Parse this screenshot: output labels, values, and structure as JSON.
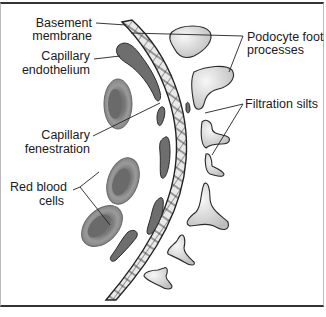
{
  "figure": {
    "labels": {
      "basement_membrane": [
        "Basement",
        "membrane"
      ],
      "capillary_endothelium": [
        "Capillary",
        "endothelium"
      ],
      "capillary_fenestration": [
        "Capillary",
        "fenestration"
      ],
      "red_blood_cells": [
        "Red blood",
        "cells"
      ],
      "podocyte_foot_processes": [
        "Podocyte foot",
        "processes"
      ],
      "filtration_slits": [
        "Filtration silts"
      ]
    },
    "colors": {
      "border": "#333333",
      "membrane_fill": "#e6e6e6",
      "endothelium_fill": "#6e6e6e",
      "rbc_outer": "#8a8a8a",
      "rbc_inner": "#6a6a6a",
      "podocyte_light": "#f2f2f2",
      "podocyte_dark": "#c4c4c4",
      "outline": "#2a2a2a"
    }
  }
}
